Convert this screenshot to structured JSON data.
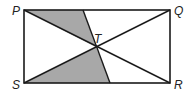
{
  "diagram": {
    "labels": {
      "P": "P",
      "Q": "Q",
      "R": "R",
      "S": "S",
      "T": "T"
    },
    "colors": {
      "stroke": "#1a1a1a",
      "shade": "#a8a8a8",
      "background": "#ffffff"
    }
  }
}
